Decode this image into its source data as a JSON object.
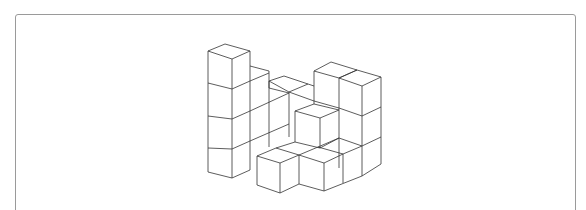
{
  "figure": {
    "line_color": "#333333",
    "frame_color": "#9a9a9a",
    "background": "#ffffff"
  }
}
